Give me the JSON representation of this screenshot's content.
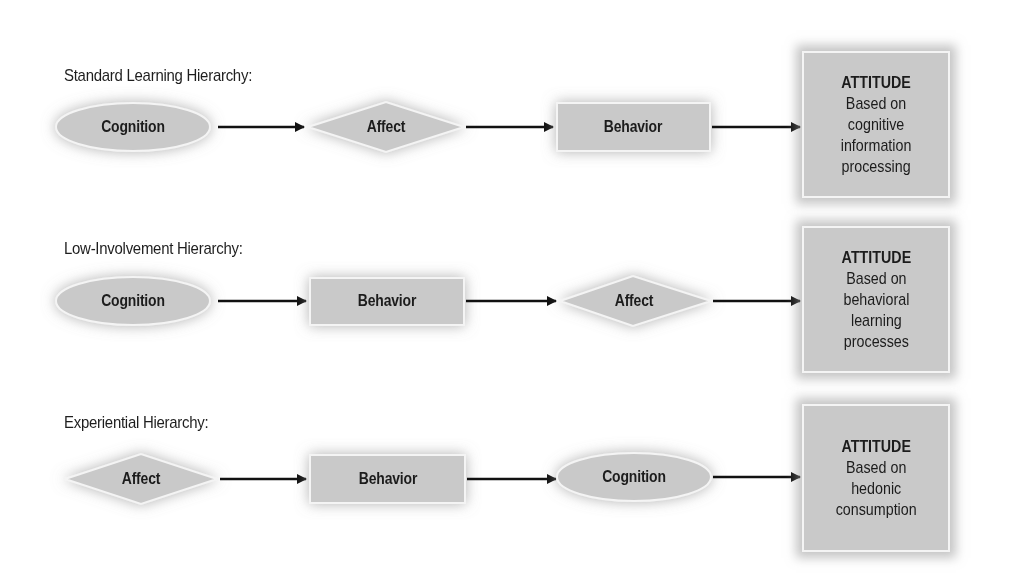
{
  "diagram": {
    "rows": [
      {
        "title": "Standard Learning Hierarchy:",
        "steps": [
          {
            "shape": "ellipse",
            "label": "Cognition"
          },
          {
            "shape": "diamond",
            "label": "Affect"
          },
          {
            "shape": "rectangle",
            "label": "Behavior"
          }
        ],
        "result": {
          "title": "ATTITUDE",
          "lines": [
            "Based on",
            "cognitive",
            "information",
            "processing"
          ]
        }
      },
      {
        "title": "Low-Involvement Hierarchy:",
        "steps": [
          {
            "shape": "ellipse",
            "label": "Cognition"
          },
          {
            "shape": "rectangle",
            "label": "Behavior"
          },
          {
            "shape": "diamond",
            "label": "Affect"
          }
        ],
        "result": {
          "title": "ATTITUDE",
          "lines": [
            "Based on",
            "behavioral",
            "learning",
            "processes"
          ]
        }
      },
      {
        "title": "Experiential Hierarchy:",
        "steps": [
          {
            "shape": "diamond",
            "label": "Affect"
          },
          {
            "shape": "rectangle",
            "label": "Behavior"
          },
          {
            "shape": "ellipse",
            "label": "Cognition"
          }
        ],
        "result": {
          "title": "ATTITUDE",
          "lines": [
            "Based on",
            "hedonic",
            "consumption"
          ]
        }
      }
    ],
    "colors": {
      "shape_fill": "#c9c9c9",
      "shape_border": "#f4f4f4",
      "arrow": "#111111",
      "text": "#1c1c1c"
    }
  }
}
